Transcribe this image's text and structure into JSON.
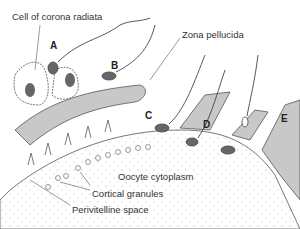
{
  "labels": {
    "corona": "Cell of corona radiata",
    "zona": "Zona pellucida",
    "oocyte": "Oocyte cytoplasm",
    "cortical": "Cortical granules",
    "perivitelline": "Perivitelline space"
  },
  "stages": [
    "A",
    "B",
    "C",
    "D",
    "E"
  ],
  "colors": {
    "zona": "#c8c8c8",
    "nucleus": "#666666",
    "line": "#444444"
  }
}
